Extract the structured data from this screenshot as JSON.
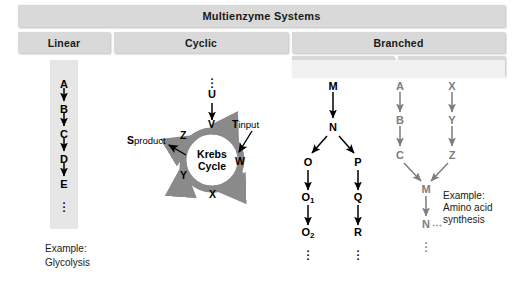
{
  "header": {
    "title": "Multienzyme Systems",
    "columns": [
      {
        "label": "Linear"
      },
      {
        "label": "Cyclic"
      },
      {
        "label": "Branched"
      }
    ],
    "branched_sub": [
      {
        "label": "Divergent"
      },
      {
        "label": "Convergent"
      }
    ]
  },
  "linear": {
    "nodes": [
      "A",
      "B",
      "C",
      "D",
      "E"
    ],
    "ellipsis": "⋮",
    "caption_line1": "Example:",
    "caption_line2": "Glycolysis"
  },
  "cyclic": {
    "title_line1": "Krebs",
    "title_line2": "Cycle",
    "ring_nodes": [
      "V",
      "W",
      "X",
      "Y",
      "Z"
    ],
    "input_node": "U",
    "input_ellipsis": "⋮",
    "product_marker": "S",
    "product_label": "product",
    "input_marker": "T",
    "input_label": "input"
  },
  "divergent": {
    "root": "M",
    "branch_point": "N",
    "left_chain": [
      "O",
      "O1",
      "O2"
    ],
    "left_chain_display": [
      "O",
      "O",
      "O"
    ],
    "left_subscripts": [
      "",
      "1",
      "2"
    ],
    "right_chain": [
      "P",
      "Q",
      "R"
    ],
    "ellipsis": "⋮"
  },
  "convergent": {
    "left_chain": [
      "A",
      "B",
      "C"
    ],
    "right_chain": [
      "X",
      "Y",
      "Z"
    ],
    "junction": "M",
    "tail": "N",
    "tail_ellipsis": "⋯",
    "ellipsis": "⋮",
    "caption_line1": "Example:",
    "caption_line2": "Amino acid",
    "caption_line3": "synthesis"
  },
  "colors": {
    "bar_fill": "#d9d9d9",
    "band_fill": "#e6e6e6",
    "ring_gray": "#8a8a8a",
    "convergent_gray": "#7d7d7d",
    "text_black": "#000000"
  }
}
